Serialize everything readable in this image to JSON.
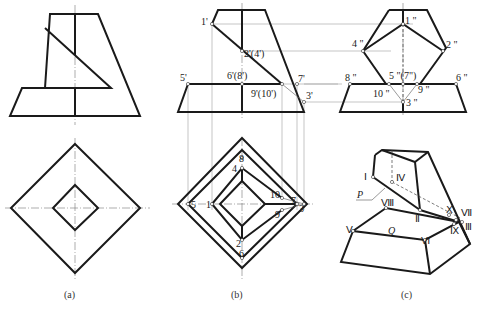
{
  "figure": {
    "captions": {
      "a": "(a)",
      "b": "(b)",
      "c": "(c)"
    },
    "view_b_front_labels": {
      "p1": "1'",
      "p2": "2'(4')",
      "p5": "5'",
      "p6": "6'(8')",
      "p7": "7'",
      "p9": "9'(10')",
      "p3": "3'"
    },
    "view_b_side_labels": {
      "p1": "1 \"",
      "p2": "2 \"",
      "p4": "4 \"",
      "p8": "8 \"",
      "p5": "5 \"(7\")",
      "p6": "6 \"",
      "p10": "10 \"",
      "p9": "9 \"",
      "p3": "3 \""
    },
    "view_b_top_labels": {
      "p8": "8",
      "p4": "4",
      "p5": "5",
      "p1": "1",
      "p10": "10",
      "p7": "7",
      "p3": "3",
      "p9": "9",
      "p2": "2",
      "p6": "6"
    },
    "view_c_labels": {
      "I": "Ⅰ",
      "IV": "Ⅳ",
      "P": "P",
      "VIII": "Ⅷ",
      "II": "Ⅱ",
      "X": "Ⅹ",
      "VII": "Ⅶ",
      "III": "Ⅲ",
      "IX": "Ⅸ",
      "V": "Ⅴ",
      "Q": "Q",
      "VI": "Ⅵ"
    }
  }
}
